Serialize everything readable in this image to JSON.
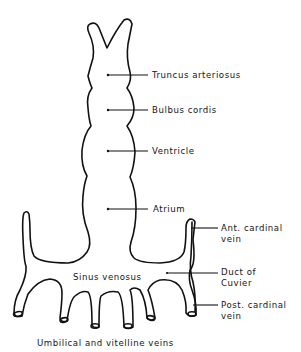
{
  "diagram": {
    "type": "anatomical-line-drawing",
    "colors": {
      "line": "#111111",
      "text": "#151515",
      "background": "#ffffff"
    },
    "labels": {
      "truncus": "Truncus arteriosus",
      "bulbus": "Bulbus cordis",
      "ventricle": "Ventricle",
      "atrium": "Atrium",
      "ant_cardinal_1": "Ant. cardinal",
      "ant_cardinal_2": "vein",
      "sinus": "Sinus venosus",
      "duct_1": "Duct of",
      "duct_2": "Cuvier",
      "post_cardinal_1": "Post. cardinal",
      "post_cardinal_2": "vein",
      "umbilical": "Umbilical and vitelline veins"
    }
  }
}
